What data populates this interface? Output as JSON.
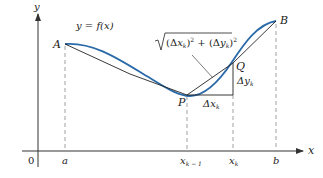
{
  "figure": {
    "curve_label": "y = f(x)",
    "arc_length_label": "√(Δx_k)² + (Δy_k)²",
    "arc_parts": {
      "open": "(Δ",
      "x": "x",
      "k1": "k",
      "mid": ")",
      "sq1": "2",
      "plus": " + (Δ",
      "y": "y",
      "k2": "k",
      "close": ")",
      "sq2": "2"
    },
    "axes": {
      "x_label": "x",
      "y_label": "y",
      "origin_label": "0"
    },
    "points": {
      "A": "A",
      "B": "B",
      "P": "P",
      "Q": "Q"
    },
    "tick_labels": {
      "a": "a",
      "b": "b",
      "xk_minus_1_base": "x",
      "xk_minus_1_sub": "k − 1",
      "xk_base": "x",
      "xk_sub": "k"
    },
    "delta_labels": {
      "dx_base": "Δx",
      "dx_sub": "k",
      "dy_base": "Δy",
      "dy_sub": "k"
    },
    "colors": {
      "curve": "#2a6aa8",
      "chord": "#222222",
      "axis": "#333333",
      "dashed": "#888888"
    }
  }
}
